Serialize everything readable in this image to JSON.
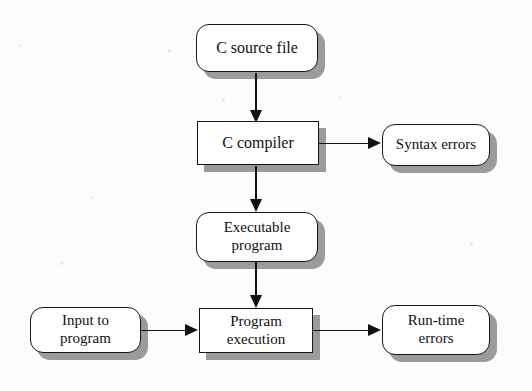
{
  "diagram": {
    "colors": {
      "node_fill": "#ffffff",
      "node_border": "#16161a",
      "shadow": "#9b9b9b",
      "arrow": "#111115",
      "background": "#fdfdfd"
    },
    "nodes": [
      {
        "id": "c-source-file",
        "label": "C source file",
        "shape": "rounded"
      },
      {
        "id": "c-compiler",
        "label": "C compiler",
        "shape": "sharp"
      },
      {
        "id": "syntax-errors",
        "label": "Syntax errors",
        "shape": "rounded"
      },
      {
        "id": "executable-program",
        "label": "Executable\nprogram",
        "shape": "rounded"
      },
      {
        "id": "input-to-program",
        "label": "Input to\nprogram",
        "shape": "rounded"
      },
      {
        "id": "program-execution",
        "label": "Program\nexecution",
        "shape": "sharp"
      },
      {
        "id": "run-time-errors",
        "label": "Run-time\nerrors",
        "shape": "rounded"
      }
    ],
    "edges": [
      {
        "from": "c-source-file",
        "to": "c-compiler",
        "direction": "down"
      },
      {
        "from": "c-compiler",
        "to": "syntax-errors",
        "direction": "right"
      },
      {
        "from": "c-compiler",
        "to": "executable-program",
        "direction": "down"
      },
      {
        "from": "executable-program",
        "to": "program-execution",
        "direction": "down"
      },
      {
        "from": "input-to-program",
        "to": "program-execution",
        "direction": "right"
      },
      {
        "from": "program-execution",
        "to": "run-time-errors",
        "direction": "right"
      }
    ]
  }
}
